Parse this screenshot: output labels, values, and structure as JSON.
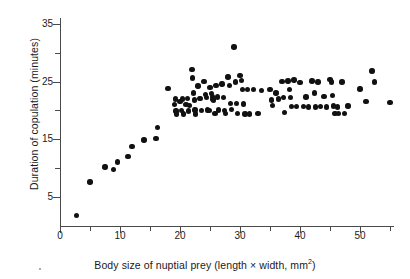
{
  "chart_data": {
    "type": "scatter",
    "title": "",
    "xlabel_text": "Body size of nuptial prey (length × width, mm",
    "xlabel_sup": "2",
    "xlabel_tail": ")",
    "ylabel": "Duration of copulation (minutes)",
    "xlim": [
      0,
      55.5
    ],
    "ylim": [
      0,
      36
    ],
    "grid": false,
    "legend": null,
    "marker": {
      "shape": "circle",
      "color": "#111111",
      "size_px": 5.4
    },
    "xticks_major": [
      0,
      10,
      20,
      30,
      40,
      50
    ],
    "xticks_minor": [
      5,
      15,
      25,
      35,
      45,
      55
    ],
    "xticklabels": [
      "0",
      "10",
      "20",
      "30",
      "40",
      "50"
    ],
    "yticks_major": [
      5,
      15,
      25,
      35
    ],
    "yticks_minor": [
      10,
      20,
      30
    ],
    "yticklabels": [
      "5",
      "15",
      "25",
      "35"
    ],
    "n_points": 118,
    "points": [
      [
        2.7,
        1.8
      ],
      [
        5.0,
        7.6
      ],
      [
        7.5,
        10.2
      ],
      [
        8.9,
        9.8
      ],
      [
        9.6,
        11.1
      ],
      [
        11.3,
        12.0
      ],
      [
        12.0,
        13.8
      ],
      [
        14.0,
        14.9
      ],
      [
        16.0,
        15.1
      ],
      [
        16.2,
        17.1
      ],
      [
        18.0,
        23.8
      ],
      [
        19.1,
        21.0
      ],
      [
        19.2,
        22.0
      ],
      [
        19.3,
        19.9
      ],
      [
        19.4,
        19.4
      ],
      [
        20.0,
        21.6
      ],
      [
        20.2,
        20.0
      ],
      [
        20.4,
        22.0
      ],
      [
        20.6,
        19.4
      ],
      [
        21.0,
        21.0
      ],
      [
        21.2,
        22.1
      ],
      [
        21.4,
        19.9
      ],
      [
        21.6,
        20.9
      ],
      [
        22.0,
        27.1
      ],
      [
        22.1,
        25.6
      ],
      [
        22.2,
        23.0
      ],
      [
        22.4,
        21.8
      ],
      [
        22.5,
        20.1
      ],
      [
        22.6,
        19.4
      ],
      [
        23.0,
        24.2
      ],
      [
        23.2,
        22.1
      ],
      [
        23.4,
        22.1
      ],
      [
        23.6,
        20.0
      ],
      [
        24.0,
        25.0
      ],
      [
        24.2,
        22.8
      ],
      [
        24.4,
        22.2
      ],
      [
        24.6,
        20.1
      ],
      [
        24.8,
        20.0
      ],
      [
        25.0,
        24.0
      ],
      [
        25.2,
        22.9
      ],
      [
        25.4,
        22.4
      ],
      [
        25.5,
        22.0
      ],
      [
        25.6,
        21.8
      ],
      [
        25.8,
        19.5
      ],
      [
        26.0,
        24.3
      ],
      [
        26.2,
        22.3
      ],
      [
        26.4,
        20.1
      ],
      [
        27.0,
        24.6
      ],
      [
        27.2,
        22.2
      ],
      [
        27.4,
        20.0
      ],
      [
        27.6,
        19.5
      ],
      [
        28.0,
        25.8
      ],
      [
        28.2,
        24.3
      ],
      [
        28.4,
        21.2
      ],
      [
        28.6,
        20.2
      ],
      [
        29.0,
        31.0
      ],
      [
        29.2,
        24.9
      ],
      [
        29.4,
        21.2
      ],
      [
        29.6,
        19.5
      ],
      [
        30.0,
        26.1
      ],
      [
        30.2,
        25.2
      ],
      [
        30.4,
        23.6
      ],
      [
        30.6,
        21.1
      ],
      [
        30.8,
        19.4
      ],
      [
        31.2,
        23.6
      ],
      [
        31.6,
        19.4
      ],
      [
        32.2,
        23.6
      ],
      [
        33.0,
        19.5
      ],
      [
        33.6,
        23.5
      ],
      [
        35.0,
        23.6
      ],
      [
        35.2,
        21.8
      ],
      [
        35.4,
        20.9
      ],
      [
        36.0,
        23.0
      ],
      [
        36.4,
        22.0
      ],
      [
        37.0,
        25.0
      ],
      [
        37.2,
        22.2
      ],
      [
        37.4,
        19.6
      ],
      [
        38.0,
        25.1
      ],
      [
        38.2,
        23.6
      ],
      [
        38.4,
        22.2
      ],
      [
        38.6,
        20.7
      ],
      [
        39.0,
        25.3
      ],
      [
        39.4,
        20.7
      ],
      [
        40.0,
        24.8
      ],
      [
        40.6,
        20.7
      ],
      [
        41.0,
        22.3
      ],
      [
        41.4,
        20.6
      ],
      [
        42.0,
        25.1
      ],
      [
        42.4,
        23.0
      ],
      [
        42.6,
        20.6
      ],
      [
        43.0,
        24.9
      ],
      [
        43.4,
        20.7
      ],
      [
        44.0,
        22.4
      ],
      [
        44.4,
        20.6
      ],
      [
        45.0,
        25.4
      ],
      [
        45.2,
        24.9
      ],
      [
        45.4,
        22.6
      ],
      [
        45.6,
        20.8
      ],
      [
        45.8,
        19.5
      ],
      [
        46.2,
        20.6
      ],
      [
        46.4,
        19.5
      ],
      [
        47.0,
        24.9
      ],
      [
        47.4,
        19.5
      ],
      [
        48.0,
        20.8
      ],
      [
        50.0,
        23.7
      ],
      [
        51.0,
        21.5
      ],
      [
        52.0,
        26.8
      ],
      [
        52.4,
        24.9
      ],
      [
        55.0,
        21.4
      ]
    ]
  }
}
